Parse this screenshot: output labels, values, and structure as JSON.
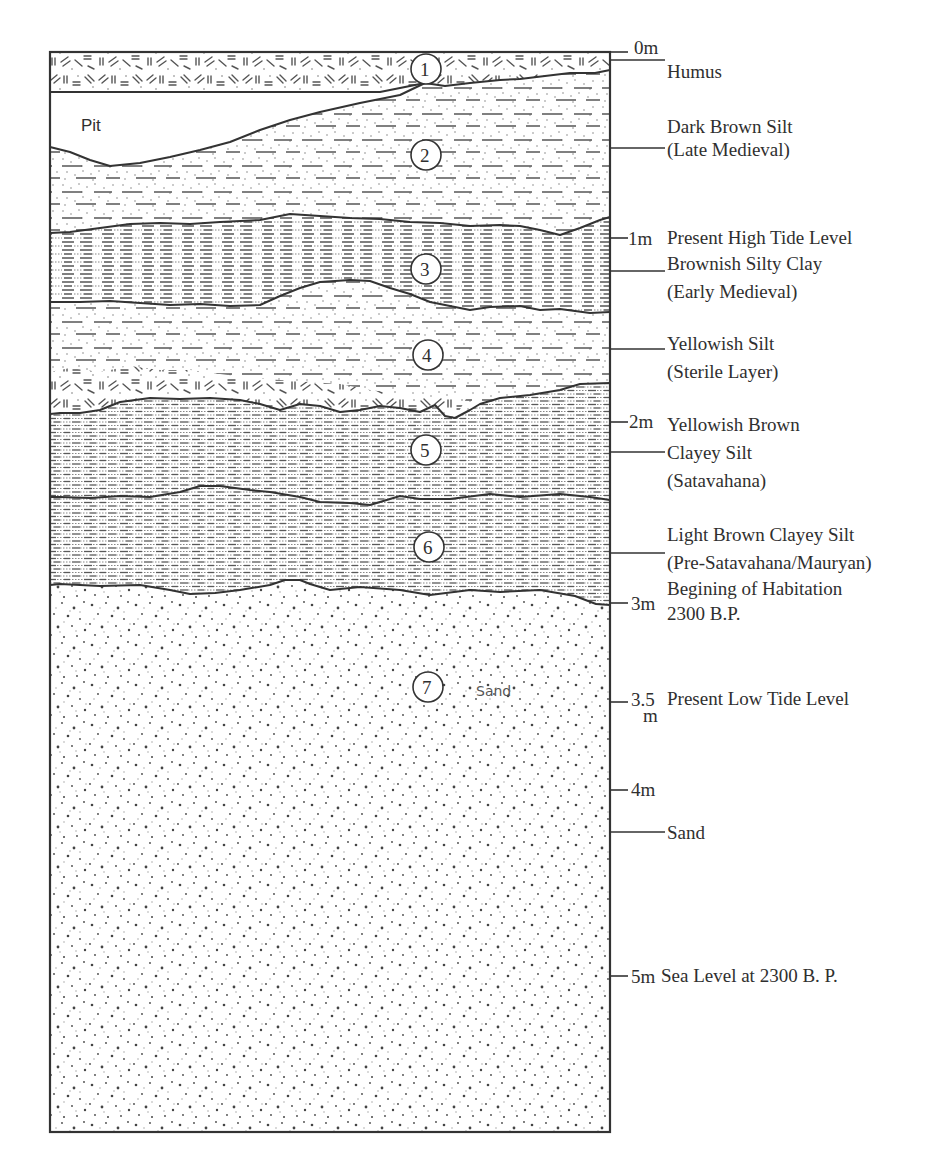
{
  "diagram": {
    "type": "stratigraphic-section",
    "scale": {
      "ticks": [
        {
          "label": "0m",
          "depth_m": 0
        },
        {
          "label": "1m",
          "depth_m": 1
        },
        {
          "label": "2m",
          "depth_m": 2
        },
        {
          "label": "3m",
          "depth_m": 3
        },
        {
          "label": "3.5",
          "label_unit": "m",
          "depth_m": 3.5
        },
        {
          "label": "4m",
          "depth_m": 4
        },
        {
          "label": "5m",
          "depth_m": 5
        }
      ]
    },
    "layers": [
      {
        "number": "1",
        "name": "Humus"
      },
      {
        "number": "2",
        "name": "Dark Brown Silt",
        "period": "(Late Medieval)"
      },
      {
        "number": "3",
        "name": "Brownish Silty Clay",
        "period": "(Early Medieval)"
      },
      {
        "number": "4",
        "name": "Yellowish Silt",
        "period": "(Sterile Layer)"
      },
      {
        "number": "5",
        "name_line1": "Yellowish Brown",
        "name_line2": "Clayey Silt",
        "period": "(Satavahana)"
      },
      {
        "number": "6",
        "name": "Light Brown Clayey Silt",
        "period": "(Pre-Satavahana/Mauryan)"
      },
      {
        "number": "7",
        "name": "Sand",
        "inline_label": "Sand"
      }
    ],
    "features": {
      "pit_label": "Pit"
    },
    "annotations": {
      "high_tide": "Present High Tide Level",
      "habitation_line1": "Begining of Habitation",
      "habitation_line2": "2300 B.P.",
      "low_tide": "Present Low Tide Level",
      "sea_level": "Sea Level at 2300 B. P."
    }
  }
}
